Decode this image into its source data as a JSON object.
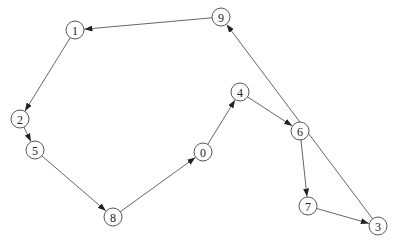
{
  "graph": {
    "directed": true,
    "node_radius": 9,
    "colors": {
      "edge": "#555555",
      "node_stroke": "#444444",
      "node_fill": "#ffffff",
      "label": "#222222"
    },
    "nodes": [
      {
        "id": "0",
        "label": "0",
        "x": 203,
        "y": 152
      },
      {
        "id": "1",
        "label": "1",
        "x": 75,
        "y": 30
      },
      {
        "id": "2",
        "label": "2",
        "x": 20,
        "y": 119
      },
      {
        "id": "3",
        "label": "3",
        "x": 378,
        "y": 226
      },
      {
        "id": "4",
        "label": "4",
        "x": 240,
        "y": 92
      },
      {
        "id": "5",
        "label": "5",
        "x": 35,
        "y": 150
      },
      {
        "id": "6",
        "label": "6",
        "x": 300,
        "y": 131
      },
      {
        "id": "7",
        "label": "7",
        "x": 308,
        "y": 206
      },
      {
        "id": "8",
        "label": "8",
        "x": 113,
        "y": 217
      },
      {
        "id": "9",
        "label": "9",
        "x": 221,
        "y": 17
      }
    ],
    "edges": [
      {
        "from": "9",
        "to": "1"
      },
      {
        "from": "1",
        "to": "2"
      },
      {
        "from": "2",
        "to": "5"
      },
      {
        "from": "5",
        "to": "8"
      },
      {
        "from": "8",
        "to": "0"
      },
      {
        "from": "0",
        "to": "4"
      },
      {
        "from": "4",
        "to": "6"
      },
      {
        "from": "6",
        "to": "7"
      },
      {
        "from": "7",
        "to": "3"
      },
      {
        "from": "3",
        "to": "9"
      }
    ]
  }
}
